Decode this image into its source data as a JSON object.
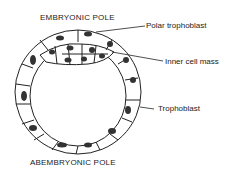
{
  "diagram": {
    "top_label": "EMBRYONIC POLE",
    "bottom_label": "ABEMBRYONIC POLE",
    "annotations": [
      {
        "id": "polar",
        "text": "Polar trophoblast"
      },
      {
        "id": "icm",
        "text": "Inner cell mass"
      },
      {
        "id": "troph",
        "text": "Trophoblast"
      }
    ]
  }
}
